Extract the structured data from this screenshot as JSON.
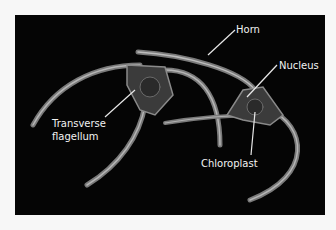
{
  "figure": {
    "labels": {
      "horn": "Horn",
      "nucleus": "Nucleus",
      "transverse_flagellum_line1": "Transverse",
      "transverse_flagellum_line2": "flagellum",
      "chloroplast": "Chloroplast"
    },
    "colors": {
      "background": "#050505",
      "label_text": "#f2f2f2",
      "page": "#f7f7f7"
    }
  }
}
